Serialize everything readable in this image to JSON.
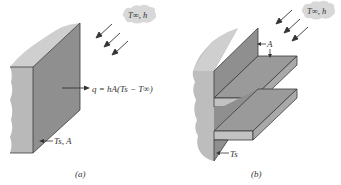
{
  "figure": {
    "panel_a": {
      "caption": "(a)",
      "ambient_label": "T∞, h",
      "heat_rate_label": "q = hA(Ts − T∞)",
      "surface_label": "Ts, A"
    },
    "panel_b": {
      "caption": "(b)",
      "ambient_label": "T∞, h",
      "area_label": "A",
      "surface_label": "Ts"
    },
    "colors": {
      "face_dark": "#8e8e8e",
      "face_mid": "#a6a6a6",
      "face_light": "#c8c8c8",
      "edge": "#3a3a3a",
      "cloud": "#d8d8d8",
      "text": "#333333"
    }
  }
}
